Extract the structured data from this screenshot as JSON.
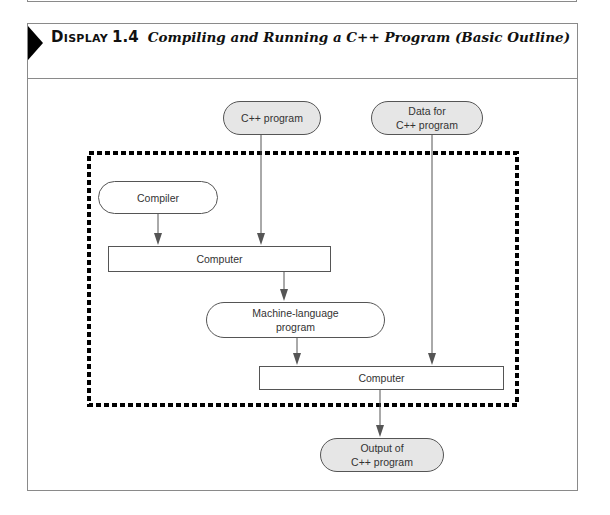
{
  "header": {
    "display_label": "Display",
    "display_number": "1.4",
    "caption": "Compiling and Running a C++ Program (Basic Outline)"
  },
  "nodes": {
    "cpp_program": {
      "label": "C++ program",
      "fill": "#e6e6e6",
      "shape": "rounded"
    },
    "data_for_program": {
      "line1": "Data for",
      "line2": "C++ program",
      "fill": "#e6e6e6",
      "shape": "rounded"
    },
    "compiler": {
      "label": "Compiler",
      "fill": "#ffffff",
      "shape": "rounded"
    },
    "computer_1": {
      "label": "Computer",
      "fill": "#ffffff",
      "shape": "rectangle"
    },
    "machine_language": {
      "line1": "Machine-language",
      "line2": "program",
      "fill": "#ffffff",
      "shape": "rounded"
    },
    "computer_2": {
      "label": "Computer",
      "fill": "#ffffff",
      "shape": "rectangle"
    },
    "output": {
      "line1": "Output of",
      "line2": "C++ program",
      "fill": "#e6e6e6",
      "shape": "rounded"
    }
  },
  "edges": [
    {
      "from": "compiler",
      "to": "computer_1"
    },
    {
      "from": "cpp_program",
      "to": "computer_1"
    },
    {
      "from": "computer_1",
      "to": "machine_language"
    },
    {
      "from": "machine_language",
      "to": "computer_2"
    },
    {
      "from": "data_for_program",
      "to": "computer_2"
    },
    {
      "from": "computer_2",
      "to": "output"
    }
  ],
  "boundary": {
    "style": "thick dashed",
    "contains": [
      "compiler",
      "computer_1",
      "machine_language",
      "computer_2"
    ]
  },
  "colors": {
    "frame": "#8a8a8a",
    "node_border": "#555555",
    "gray_fill": "#e6e6e6",
    "arrow": "#555555",
    "dash": "#000000"
  }
}
